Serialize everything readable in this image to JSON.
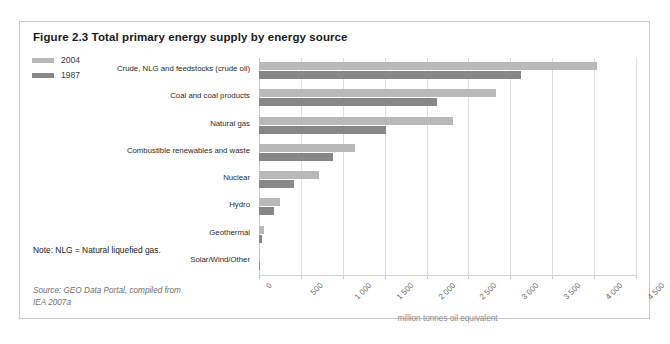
{
  "figure": {
    "title": "Figure 2.3 Total primary energy supply by energy source",
    "note": "Note: NLG = Natural liquefied gas.",
    "source": "Source: GEO Data Portal, compiled from IEA 2007a"
  },
  "legend": {
    "items": [
      {
        "label": "2004",
        "color": "#b9b9b9"
      },
      {
        "label": "1987",
        "color": "#878787"
      }
    ]
  },
  "colors": {
    "series_2004": "#b9b9b9",
    "series_1987": "#878787",
    "gridline": "#dddddd",
    "frame": "#c9c9c9",
    "axis_label": "#6a6a6a"
  },
  "chart_data": {
    "type": "bar",
    "orientation": "horizontal",
    "title": "Figure 2.3 Total primary energy supply by energy source",
    "xlabel": "million tonnes oil equivalent",
    "ylabel": "",
    "xlim": [
      0,
      4500
    ],
    "xticks": [
      0,
      500,
      1000,
      1500,
      2000,
      2500,
      3000,
      3500,
      4000,
      4500
    ],
    "xtick_labels": [
      "0",
      "500",
      "1 000",
      "1 500",
      "2 000",
      "2 500",
      "3 000",
      "3 500",
      "4 000",
      "4 500"
    ],
    "grid": true,
    "legend_position": "top-left",
    "categories": [
      "Crude, NLG and feedstocks (crude oil)",
      "Coal and coal products",
      "Natural gas",
      "Combustible renewables and waste",
      "Nuclear",
      "Hydro",
      "Geothermal",
      "Solar/Wind/Other"
    ],
    "series": [
      {
        "name": "2004",
        "color": "#b9b9b9",
        "values": [
          4040,
          2830,
          2310,
          1150,
          720,
          250,
          60,
          12
        ]
      },
      {
        "name": "1987",
        "color": "#878787",
        "values": [
          3130,
          2130,
          1510,
          880,
          420,
          180,
          30,
          4
        ]
      }
    ]
  }
}
